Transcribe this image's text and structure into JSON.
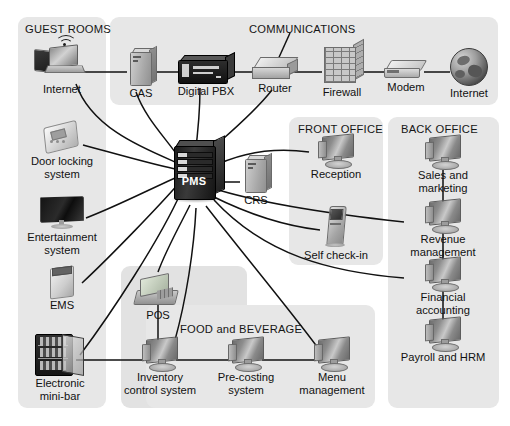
{
  "diagram": {
    "background_color": "#ffffff",
    "panel_color": "#e7e7e7",
    "line_color": "#111111"
  },
  "panels": [
    {
      "id": "guest_rooms",
      "label": "GUEST ROOMS"
    },
    {
      "id": "communications",
      "label": "COMMUNICATIONS"
    },
    {
      "id": "front_office",
      "label": "FRONT OFFICE"
    },
    {
      "id": "back_office",
      "label": "BACK OFFICE"
    },
    {
      "id": "food_beverage",
      "label": "FOOD and BEVERAGE"
    },
    {
      "id": "pos_group",
      "label": ""
    }
  ],
  "nodes": {
    "guest_internet": {
      "label": "Internet",
      "icon": "laptop-tablet-wifi-icon"
    },
    "door_locking": {
      "label": "Door locking\nsystem",
      "icon": "door-lock-panel-icon"
    },
    "entertainment": {
      "label": "Entertainment\nsystem",
      "icon": "television-icon"
    },
    "ems": {
      "label": "EMS",
      "icon": "energy-management-box-icon"
    },
    "mini_bar": {
      "label": "Electronic\nmini-bar",
      "icon": "mini-bar-fridge-icon"
    },
    "cas": {
      "label": "CAS",
      "icon": "tower-server-icon"
    },
    "digital_pbx": {
      "label": "Digital PBX",
      "icon": "pbx-chassis-icon"
    },
    "router": {
      "label": "Router",
      "icon": "router-icon"
    },
    "firewall": {
      "label": "Firewall",
      "icon": "brick-wall-firewall-icon"
    },
    "modem": {
      "label": "Modem",
      "icon": "modem-icon"
    },
    "internet": {
      "label": "Internet",
      "icon": "globe-icon"
    },
    "pms": {
      "label": "PMS",
      "icon": "rack-server-icon"
    },
    "crs": {
      "label": "CRS",
      "icon": "tower-server-icon"
    },
    "reception": {
      "label": "Reception",
      "icon": "desktop-monitor-icon"
    },
    "self_check_in": {
      "label": "Self check-in",
      "icon": "kiosk-icon"
    },
    "sales_marketing": {
      "label": "Sales and marketing",
      "icon": "desktop-monitor-icon"
    },
    "revenue_mgmt": {
      "label": "Revenue management",
      "icon": "desktop-monitor-icon"
    },
    "financial_acct": {
      "label": "Financial accounting",
      "icon": "desktop-monitor-icon"
    },
    "payroll_hrm": {
      "label": "Payroll and HRM",
      "icon": "desktop-monitor-icon"
    },
    "pos": {
      "label": "POS",
      "icon": "pos-terminal-icon"
    },
    "inventory": {
      "label": "Inventory\ncontrol system",
      "icon": "desktop-monitor-icon"
    },
    "precosting": {
      "label": "Pre-costing\nsystem",
      "icon": "desktop-monitor-icon"
    },
    "menu_mgmt": {
      "label": "Menu\nmanagement",
      "icon": "desktop-monitor-icon"
    }
  },
  "connections": [
    "guest_internet-cas",
    "cas-digital_pbx",
    "digital_pbx-router",
    "router-firewall",
    "firewall-modem",
    "modem-internet",
    "guest_internet-pms",
    "door_locking-pms",
    "entertainment-pms",
    "ems-pms",
    "mini_bar-pms",
    "cas-pms",
    "digital_pbx-pms",
    "router-pms",
    "pms-crs",
    "pms-reception",
    "pms-self_check_in",
    "pms-sales_marketing",
    "pms-revenue_mgmt",
    "pms-financial_accounting",
    "pms-pos",
    "pms-inventory",
    "pms-menu_mgmt",
    "pos-inventory",
    "inventory-precosting",
    "precosting-menu_mgmt",
    "mini_bar-inventory",
    "sales_marketing-revenue_mgmt",
    "revenue_mgmt-financial_acct",
    "financial_acct-payroll_hrm"
  ]
}
